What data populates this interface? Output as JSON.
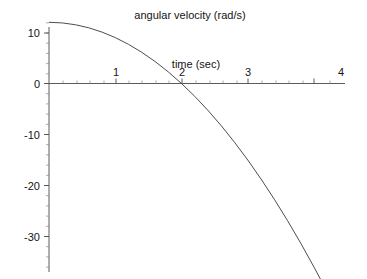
{
  "chart_data": {
    "type": "line",
    "title": "angular velocity (rad/s)",
    "xlabel": "time (sec)",
    "ylabel": "",
    "xlim": [
      0,
      4
    ],
    "ylim": [
      -37,
      12.5
    ],
    "xticks": [
      "1",
      "2",
      "3",
      "4"
    ],
    "xtick_values": [
      1,
      2,
      3,
      4
    ],
    "yticks": [
      "10",
      "0",
      "-10",
      "-20",
      "-30"
    ],
    "ytick_values": [
      10,
      0,
      -10,
      -20,
      -30
    ],
    "x_minor_step": 0.2,
    "y_minor_step": 2,
    "grid": false,
    "legend": "none",
    "series": [
      {
        "name": "angular velocity",
        "equation": "omega(t) = 12 - 3 t^2",
        "x": [
          0.0,
          0.2,
          0.4,
          0.6,
          0.8,
          1.0,
          1.2,
          1.4,
          1.6,
          1.8,
          2.0,
          2.2,
          2.4,
          2.6,
          2.8,
          3.0,
          3.2,
          3.4,
          3.6,
          3.8,
          4.0
        ],
        "values": [
          12.0,
          11.88,
          11.52,
          10.92,
          10.08,
          9.0,
          7.68,
          6.12,
          4.32,
          2.28,
          0.0,
          -2.52,
          -5.28,
          -8.28,
          -11.52,
          -15.0,
          -18.72,
          -22.68,
          -26.88,
          -31.32,
          -36.0
        ]
      }
    ],
    "annotations": [
      {
        "text": "angular velocity (rad/s)",
        "role": "plot-title",
        "position": "top-center"
      },
      {
        "text": "time (sec)",
        "role": "x-axis-label",
        "position": "above-axis-near-t2"
      }
    ]
  },
  "colors": {
    "background": "#ffffff",
    "axis": "#4a4a4a",
    "curve": "#4d4d4d",
    "text": "#141414",
    "minor_tick": "#8a8a8a"
  }
}
